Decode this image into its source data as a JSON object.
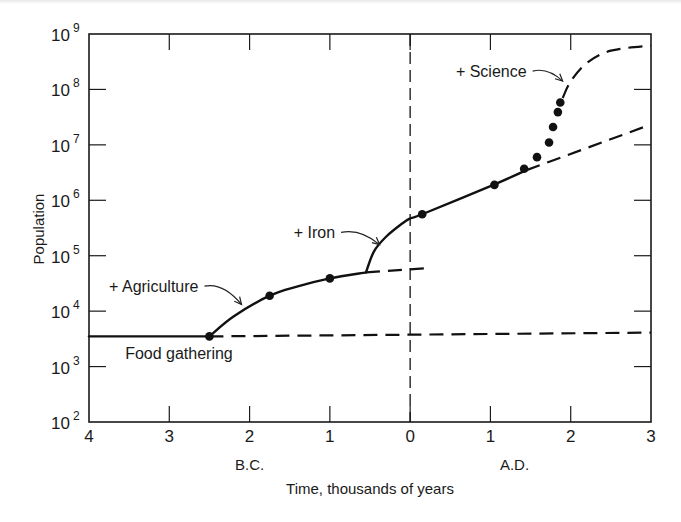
{
  "chart_data": {
    "type": "line",
    "title": "",
    "xlabel": "Time, thousands of years",
    "ylabel": "Population",
    "xlim": [
      -4,
      3
    ],
    "ylim_log10": [
      2,
      9
    ],
    "yscale": "log",
    "grid": false,
    "x_ticks": [
      {
        "value": -4,
        "label": "4"
      },
      {
        "value": -3,
        "label": "3"
      },
      {
        "value": -2,
        "label": "2"
      },
      {
        "value": -1,
        "label": "1"
      },
      {
        "value": 0,
        "label": "0"
      },
      {
        "value": 1,
        "label": "1"
      },
      {
        "value": 2,
        "label": "2"
      },
      {
        "value": 3,
        "label": "3"
      }
    ],
    "y_ticks": [
      {
        "exp": 2,
        "label": "10",
        "sup": "2"
      },
      {
        "exp": 3,
        "label": "10",
        "sup": "3"
      },
      {
        "exp": 4,
        "label": "10",
        "sup": "4"
      },
      {
        "exp": 5,
        "label": "10",
        "sup": "5"
      },
      {
        "exp": 6,
        "label": "10",
        "sup": "6"
      },
      {
        "exp": 7,
        "label": "10",
        "sup": "7"
      },
      {
        "exp": 8,
        "label": "10",
        "sup": "8"
      },
      {
        "exp": 9,
        "label": "10",
        "sup": "9"
      }
    ],
    "era_labels": [
      {
        "text": "B.C.",
        "x": -2
      },
      {
        "text": "A.D.",
        "x": 1.3
      }
    ],
    "vertical_reference_line": {
      "x": 0,
      "style": "dashed"
    },
    "series": [
      {
        "name": "Food gathering",
        "style": "solid",
        "points": [
          [
            -4,
            3500
          ],
          [
            -2.5,
            3500
          ]
        ]
      },
      {
        "name": "Food gathering (projected)",
        "style": "dashed",
        "points": [
          [
            -2.5,
            3500
          ],
          [
            3,
            4100
          ]
        ]
      },
      {
        "name": "Agriculture",
        "style": "solid",
        "points": [
          [
            -2.5,
            3500
          ],
          [
            -2.2,
            8000
          ],
          [
            -1.75,
            19000
          ],
          [
            -1.4,
            28000
          ],
          [
            -1.0,
            39000
          ],
          [
            -0.55,
            50000
          ]
        ]
      },
      {
        "name": "Agriculture (projected)",
        "style": "dashed",
        "points": [
          [
            -0.55,
            50000
          ],
          [
            0.25,
            60000
          ]
        ]
      },
      {
        "name": "Iron",
        "style": "solid",
        "points": [
          [
            -0.55,
            50000
          ],
          [
            -0.45,
            120000
          ],
          [
            -0.3,
            220000
          ],
          [
            -0.1,
            380000
          ],
          [
            0.0,
            470000
          ],
          [
            0.15,
            560000
          ],
          [
            1.0,
            1800000
          ],
          [
            1.45,
            3500000
          ]
        ]
      },
      {
        "name": "Iron (projected)",
        "style": "dashed",
        "points": [
          [
            1.45,
            3500000
          ],
          [
            2.95,
            22000000
          ]
        ]
      },
      {
        "name": "Science (projected)",
        "style": "dashed",
        "points": [
          [
            1.9,
            70000000
          ],
          [
            2.0,
            140000000
          ],
          [
            2.2,
            300000000
          ],
          [
            2.5,
            500000000
          ],
          [
            3.0,
            620000000
          ]
        ]
      }
    ],
    "data_points": [
      {
        "x": -2.5,
        "y": 3500
      },
      {
        "x": -1.75,
        "y": 19000
      },
      {
        "x": -1.0,
        "y": 39000
      },
      {
        "x": 0.15,
        "y": 560000
      },
      {
        "x": 1.05,
        "y": 1900000
      },
      {
        "x": 1.42,
        "y": 3700000
      },
      {
        "x": 1.58,
        "y": 6000000
      },
      {
        "x": 1.73,
        "y": 11000000
      },
      {
        "x": 1.78,
        "y": 21000000
      },
      {
        "x": 1.84,
        "y": 39000000
      },
      {
        "x": 1.87,
        "y": 58000000
      }
    ],
    "annotations": [
      {
        "text": "+ Agriculture",
        "label_x": -3.75,
        "label_log": 4.45,
        "arrow_to": [
          -2.1,
          4.12
        ]
      },
      {
        "text": "+ Iron",
        "label_x": -1.45,
        "label_log": 5.42,
        "arrow_to": [
          -0.38,
          5.2
        ]
      },
      {
        "text": "+ Science",
        "label_x": 0.57,
        "label_log": 8.33,
        "arrow_to": [
          1.9,
          8.15
        ]
      },
      {
        "text": "Food gathering",
        "label_x": -3.55,
        "label_log": 3.25
      }
    ]
  }
}
